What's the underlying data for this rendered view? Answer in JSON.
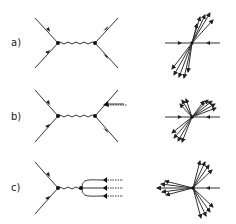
{
  "rows": [
    {
      "label": "a)",
      "description": "Feynman diagram with boson exchange, two-jet event"
    },
    {
      "label": "b)",
      "description": "Feynman diagram with gluon emission, three-jet event"
    },
    {
      "label": "c)",
      "description": "Feynman diagram with quark loop and three gluons, three-jet event"
    }
  ],
  "colors": {
    "line": "#333333",
    "background": "#ffffff"
  }
}
